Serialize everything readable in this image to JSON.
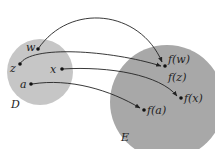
{
  "diagram": {
    "type": "function-mapping",
    "domain_set": {
      "label": "D",
      "color": "#c4c4c4"
    },
    "codomain_set": {
      "label": "E",
      "color": "#a9a9a9"
    },
    "domain_points": [
      {
        "id": "w",
        "label": "w"
      },
      {
        "id": "z",
        "label": "z"
      },
      {
        "id": "x",
        "label": "x"
      },
      {
        "id": "a",
        "label": "a"
      }
    ],
    "image_points": [
      {
        "id": "fw",
        "label": "f(w)"
      },
      {
        "id": "fz",
        "label": "f(z)"
      },
      {
        "id": "fx",
        "label": "f(x)"
      },
      {
        "id": "fa",
        "label": "f(a)"
      }
    ],
    "mappings": [
      {
        "from": "w",
        "to": "f(w)"
      },
      {
        "from": "z",
        "to": "f(z)"
      },
      {
        "from": "x",
        "to": "f(x)"
      },
      {
        "from": "a",
        "to": "f(a)"
      }
    ]
  }
}
